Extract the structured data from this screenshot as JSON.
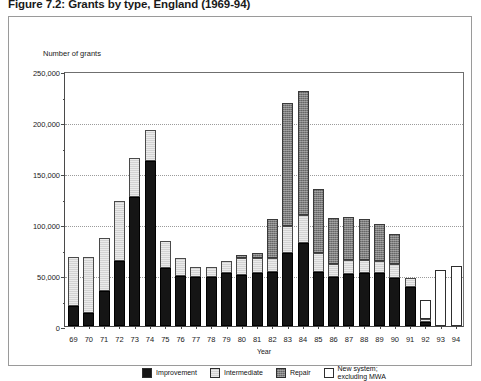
{
  "figure": {
    "title": "Figure 7.2: Grants by type, England (1969-94)"
  },
  "chart_data": {
    "type": "bar",
    "subtype": "stacked-vertical",
    "title": "Figure 7.2: Grants by type, England (1969-94)",
    "ylabel": "Number of grants",
    "xlabel": "Year",
    "ylim": [
      0,
      250000
    ],
    "ytick_values": [
      0,
      50000,
      100000,
      150000,
      200000,
      250000
    ],
    "ytick_labels": [
      "0",
      "50,000",
      "100,000",
      "150,000",
      "200,000",
      "250,000"
    ],
    "yminor_interval": 25000,
    "grid": "horizontal-dotted",
    "legend_position": "bottom-center",
    "categories": [
      "69",
      "70",
      "71",
      "72",
      "73",
      "74",
      "75",
      "76",
      "77",
      "78",
      "79",
      "80",
      "81",
      "82",
      "83",
      "84",
      "85",
      "86",
      "87",
      "88",
      "89",
      "90",
      "91",
      "92",
      "93",
      "94"
    ],
    "series": [
      {
        "name": "Improvement",
        "color": "#151515",
        "values": [
          20000,
          13000,
          34000,
          64000,
          126000,
          162000,
          57000,
          49000,
          48000,
          48000,
          52000,
          50000,
          52000,
          53000,
          72000,
          81000,
          53000,
          48000,
          51000,
          52000,
          52000,
          47000,
          38000,
          4000,
          0,
          0
        ]
      },
      {
        "name": "Intermediate",
        "color": "#d2d2d2",
        "values": [
          48000,
          55000,
          52000,
          59000,
          39000,
          30000,
          26000,
          18000,
          10000,
          10000,
          12000,
          17000,
          15000,
          14000,
          26000,
          28000,
          19000,
          13000,
          14000,
          13000,
          12000,
          14000,
          9000,
          3000,
          0,
          0
        ]
      },
      {
        "name": "Repair",
        "color": "#7d7d7d",
        "values": [
          0,
          0,
          0,
          0,
          0,
          0,
          0,
          0,
          0,
          0,
          0,
          3000,
          5000,
          38000,
          121000,
          121000,
          62000,
          45000,
          42000,
          40000,
          36000,
          29000,
          0,
          0,
          0,
          0
        ]
      },
      {
        "name": "New system; excluding MWA",
        "color": "#ffffff",
        "values": [
          0,
          0,
          0,
          0,
          0,
          0,
          0,
          0,
          0,
          0,
          0,
          0,
          0,
          0,
          0,
          0,
          0,
          0,
          0,
          0,
          0,
          0,
          0,
          19000,
          55000,
          59000
        ]
      }
    ],
    "totals": [
      68000,
      68000,
      86000,
      123000,
      165000,
      192000,
      83000,
      67000,
      58000,
      58000,
      64000,
      70000,
      72000,
      105000,
      219000,
      230000,
      134000,
      106000,
      107000,
      105000,
      100000,
      90000,
      47000,
      26000,
      55000,
      59000
    ],
    "legend": [
      {
        "label": "Improvement",
        "swatch": "improvement"
      },
      {
        "label": "Intermediate",
        "swatch": "intermediate"
      },
      {
        "label": "Repair",
        "swatch": "repair"
      },
      {
        "label": "New system;\nexcluding MWA",
        "swatch": "newsystem"
      }
    ]
  }
}
